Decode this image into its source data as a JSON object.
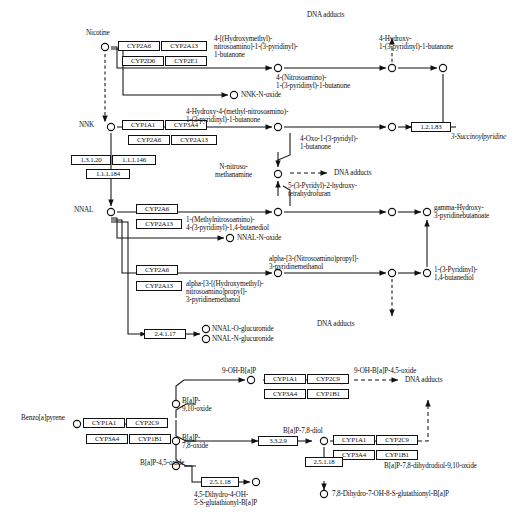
{
  "figure": {
    "node_marker": "open-circle",
    "arrow_styles": [
      "solid",
      "dashed"
    ]
  },
  "colors": {
    "ink": "#111111",
    "background": "#ffffff",
    "box_border": "#111111"
  },
  "nicotine_pathway": {
    "compounds": {
      "nicotine": "Nicotine",
      "nnk": "NNK",
      "nnal": "NNAL",
      "hydroxymethyl_nitrosoamino_butanone": "4-[(Hydroxymethyl)-\nnitrosoamino]-1-(3-pyridinyl)-\n1-butanone",
      "nitrosoamino_butanone": "4-(Nitrosoamino)-\n1-(3-pyridinyl)-1-butanone",
      "hydroxy_pyridinyl_butanone": "4-Hydroxy-\n1-(3-pyridinyl)-1-butanone",
      "nnk_n_oxide": "NNK-N-oxide",
      "hydroxy_methyl_nitrosoamino_butanone": "4-Hydroxy-4-(methyl-nitrosoamino)-\n1-(3-pyridinyl)-1-butanone",
      "oxo_pyridyl_butanone": "4-Oxo-1-(3-pyridyl)-\n1-butanone",
      "succinoylpyridine": "3-Succinoylpyridine",
      "n_nitroso_methanamine": "N-nitroso-\nmethanamine",
      "pyridyl_hydroxy_thf": "5-(3-Pyridyl)-2-hydroxy-\ntetrahydrofuran",
      "methylnitrosoamino_butanediol": "1-(Methylnitrosoamino)-\n4-(3-pyridinyl)-1,4-butanediol",
      "nnal_n_oxide": "NNAL-N-oxide",
      "alpha_hydroxymethyl_nitrosoamino_propyl": "alpha-[3-[(Hydroxymethyl)-\nnitrosoamino]propyl]-\n3-pyridinemethanol",
      "alpha_nitrosoamino_propyl": "alpha-[3-(Nitrosoamino)propyl]-\n3-pyridinemethanol",
      "nnal_o_glucuronide": "NNAL-O-glucuronide",
      "nnal_n_glucuronide": "NNAL-N-glucuronide",
      "gamma_hydroxy_pyridinebutanoate": "gamma-Hydroxy-\n3-pyridinebutanoate",
      "pyridinyl_butanediol": "1-(3-Pyridinyl)-\n1,4-butanediol",
      "dna_adducts_top": "DNA adducts",
      "dna_adducts_mid": "DNA adducts",
      "dna_adducts_bottom": "DNA adducts"
    },
    "enzymes": {
      "nicotine_group": [
        "CYP2A6",
        "CYP2A13",
        "CYP2D6",
        "CYP2E1"
      ],
      "nnk_group": [
        "CYP1A1",
        "CYP3A4",
        "CYP2A6",
        "CYP2A13"
      ],
      "nnk_to_nnal": [
        "1.3.1.20",
        "1.1.1.146",
        "1.1.1.184"
      ],
      "nnal_group_1": [
        "CYP2A6",
        "CYP2A13"
      ],
      "nnal_group_2": [
        "CYP2A6",
        "CYP2A13"
      ],
      "nnal_glucuronide": "2.4.1.17",
      "succinoyl": "1.2.1.83"
    }
  },
  "bap_pathway": {
    "compounds": {
      "benzo_a_pyrene": "Benzo[a]pyrene",
      "bap_9_10_oxide": "B[a]P-\n9,10-oxide",
      "bap_7_8_oxide": "B[a]P-\n7,8-oxide",
      "bap_4_5_oxide": "B[a]P-4,5-oxide",
      "oh_bap_9": "9-OH-B[a]P",
      "oh_bap_9_4_5_oxide": "9-OH-B[a]P-4,5-oxide",
      "bap_7_8_diol": "B[a]P-7,8-diol",
      "bap_7_8_dihydrodiol_9_10_oxide": "B[a]P-7,8-dihydrodiol-9,10-oxide",
      "dihydro_oh_glutathionyl": "4,5-Dihydro-4-OH-\n5-S-glutathionyl-B[a]P",
      "dihydro_7_oh_8_glutathionyl": "7,8-Dihydro-7-OH-8-S-glutathionyl-B[a]P",
      "dna_adducts": "DNA adducts"
    },
    "enzymes": {
      "bap_group": [
        "CYP1A1",
        "CYP2C9",
        "CYP3A4",
        "CYP1B1"
      ],
      "oh_bap_group": [
        "CYP1A1",
        "CYP2C9",
        "CYP3A4",
        "CYP1B1"
      ],
      "diol_group": [
        "CYP1A1",
        "CYP2C9",
        "CYP3A4",
        "CYP1B1"
      ],
      "epoxide_hydrolase": "3.3.2.9",
      "gst_1": "2.5.1.18",
      "gst_2": "2.5.1.18"
    }
  }
}
